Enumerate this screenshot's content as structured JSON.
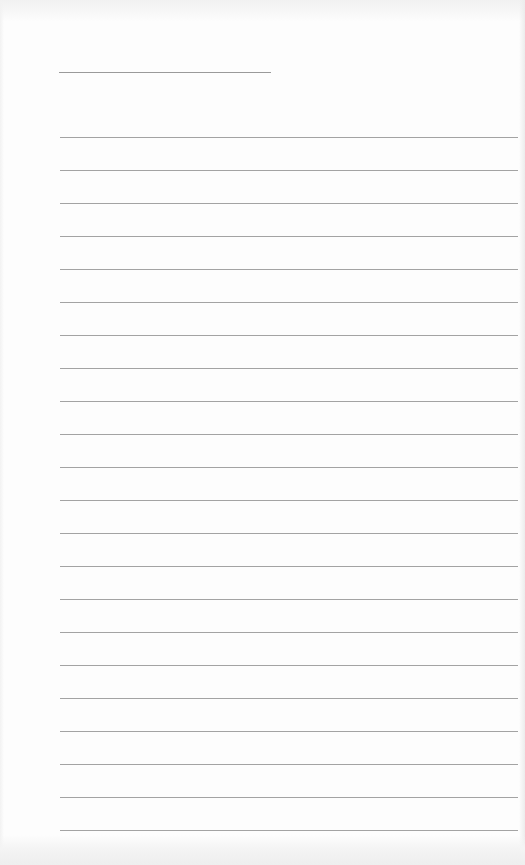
{
  "page": {
    "type": "lined-notepad",
    "background_color": "#fdfdfd",
    "line_color": "#a3a3a3"
  },
  "title_line": {
    "left": 59,
    "top": 72,
    "width": 212,
    "text": ""
  },
  "ruled_lines": {
    "count": 22,
    "first_top": 137,
    "spacing": 33,
    "left": 60,
    "right": 518,
    "texts": [
      "",
      "",
      "",
      "",
      "",
      "",
      "",
      "",
      "",
      "",
      "",
      "",
      "",
      "",
      "",
      "",
      "",
      "",
      "",
      "",
      "",
      ""
    ]
  }
}
